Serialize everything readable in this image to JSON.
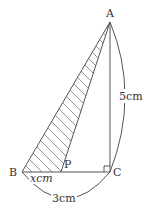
{
  "figure": {
    "points": {
      "A": {
        "label": "A",
        "x": 110,
        "y": 22
      },
      "B": {
        "label": "B",
        "x": 22,
        "y": 172
      },
      "C": {
        "label": "C",
        "x": 110,
        "y": 172
      },
      "P": {
        "label": "P",
        "x": 61,
        "y": 172
      }
    },
    "measures": {
      "AC": {
        "value": "5",
        "unit": "cm",
        "text": "5cm"
      },
      "BC": {
        "value": "3",
        "unit": "cm",
        "text": "3cm"
      },
      "BP": {
        "var": "x",
        "unit": "cm",
        "text": "xcm"
      }
    },
    "shaded_region": "triangle ABP",
    "right_angle_at": "C",
    "colors": {
      "line": "#555555",
      "text": "#333333",
      "hatch": "#777777"
    }
  }
}
